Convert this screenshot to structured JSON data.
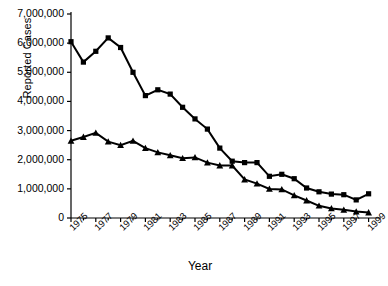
{
  "chart_data": {
    "type": "line",
    "title": "",
    "xlabel": "Year",
    "ylabel": "Reported Cases",
    "xlim": [
      1975,
      2000
    ],
    "ylim": [
      0,
      7000000
    ],
    "grid": false,
    "legend": "none",
    "ytick_labels": [
      "0",
      "1,000,000",
      "2,000,000",
      "3,000,000",
      "4,000,000",
      "5,000,000",
      "6,000,000",
      "7,000,000"
    ],
    "ytick_values": [
      0,
      1000000,
      2000000,
      3000000,
      4000000,
      5000000,
      6000000,
      7000000
    ],
    "xtick_labels": [
      "1975",
      "1977",
      "1979",
      "1981",
      "1983",
      "1985",
      "1987",
      "1989",
      "1991",
      "1993",
      "1995",
      "1997",
      "1999"
    ],
    "xtick_values": [
      1975,
      1977,
      1979,
      1981,
      1983,
      1985,
      1987,
      1989,
      1991,
      1993,
      1995,
      1997,
      1999
    ],
    "x": [
      1975,
      1976,
      1977,
      1978,
      1979,
      1980,
      1981,
      1982,
      1983,
      1984,
      1985,
      1986,
      1987,
      1988,
      1989,
      1990,
      1991,
      1992,
      1993,
      1994,
      1995,
      1996,
      1997,
      1998,
      1999
    ],
    "series": [
      {
        "name": "upper-series",
        "marker": "square",
        "color": "#000000",
        "values": [
          6050000,
          5350000,
          5720000,
          6180000,
          5850000,
          5000000,
          4200000,
          4400000,
          4250000,
          3800000,
          3400000,
          3050000,
          2400000,
          1950000,
          1900000,
          1900000,
          1430000,
          1500000,
          1350000,
          1030000,
          900000,
          820000,
          800000,
          620000,
          830000
        ]
      },
      {
        "name": "lower-series",
        "marker": "triangle",
        "color": "#000000",
        "values": [
          2650000,
          2780000,
          2920000,
          2620000,
          2500000,
          2650000,
          2400000,
          2250000,
          2150000,
          2050000,
          2080000,
          1900000,
          1800000,
          1800000,
          1320000,
          1180000,
          1000000,
          980000,
          780000,
          600000,
          420000,
          330000,
          280000,
          220000,
          190000
        ]
      }
    ]
  }
}
